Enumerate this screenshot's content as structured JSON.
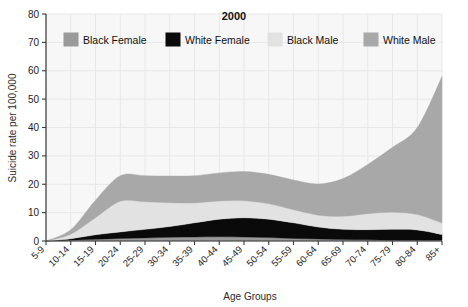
{
  "chart_data": {
    "type": "area",
    "title": "2000",
    "xlabel": "Age Groups",
    "ylabel": "Suicide rate per 100,000",
    "ylim": [
      0,
      80
    ],
    "yticks": [
      0,
      10,
      20,
      30,
      40,
      50,
      60,
      70,
      80
    ],
    "grid": true,
    "legend_position": "top",
    "stacked": true,
    "stack_order": [
      "Black Female",
      "White Female",
      "Black Male",
      "White Male"
    ],
    "categories": [
      "5-9",
      "10-14",
      "15-19",
      "20-24",
      "25-29",
      "30-34",
      "35-39",
      "40-44",
      "45-49",
      "50-54",
      "55-59",
      "60-64",
      "65-69",
      "70-74",
      "75-79",
      "80-84",
      "85+"
    ],
    "series": [
      {
        "name": "Black Female",
        "color": "#9a9a9a",
        "values": [
          0.0,
          0.3,
          0.6,
          0.9,
          1.1,
          1.3,
          1.4,
          1.5,
          1.4,
          1.2,
          0.9,
          0.7,
          0.5,
          0.4,
          0.3,
          0.3,
          0.3
        ]
      },
      {
        "name": "White Female",
        "color": "#0a0a0a",
        "values": [
          0.0,
          0.5,
          1.6,
          2.3,
          3.0,
          3.8,
          5.0,
          6.2,
          6.8,
          6.5,
          5.5,
          4.2,
          3.6,
          3.6,
          3.8,
          3.6,
          2.0
        ]
      },
      {
        "name": "Black Male",
        "color": "#e2e2e2",
        "values": [
          0.0,
          1.6,
          6.0,
          10.8,
          9.7,
          8.4,
          7.0,
          6.4,
          6.0,
          5.4,
          4.6,
          4.2,
          4.6,
          5.6,
          6.0,
          5.4,
          4.0
        ]
      },
      {
        "name": "White Male",
        "color": "#a8a8a8",
        "values": [
          0.0,
          1.6,
          6.2,
          9.0,
          9.2,
          9.4,
          9.6,
          9.9,
          10.3,
          10.4,
          10.5,
          11.0,
          13.3,
          17.4,
          22.9,
          30.7,
          51.7
        ]
      }
    ],
    "totals": [
      0.0,
      4.0,
      14.4,
      23.0,
      23.0,
      22.9,
      23.0,
      24.0,
      24.5,
      23.5,
      21.5,
      20.1,
      22.0,
      27.0,
      33.0,
      40.0,
      58.0
    ]
  },
  "legend": {
    "items": [
      {
        "label": "Black Female",
        "color": "#9a9a9a"
      },
      {
        "label": "White Female",
        "color": "#0a0a0a"
      },
      {
        "label": "Black Male",
        "color": "#e2e2e2"
      },
      {
        "label": "White Male",
        "color": "#a8a8a8"
      }
    ]
  },
  "yticks_labels": [
    "0",
    "10",
    "20",
    "30",
    "40",
    "50",
    "60",
    "70",
    "80"
  ],
  "colors": {
    "plot_background": "#f7f7f7",
    "grid": "#e8e8e8",
    "axis": "#3a3a3a",
    "page_background": "#ffffff"
  }
}
